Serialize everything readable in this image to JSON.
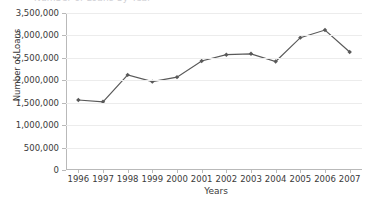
{
  "figure": {
    "cropped_title": "Number of Loans by Year",
    "width": 368,
    "height": 202
  },
  "axes": {
    "ylabel": "Number of Loans",
    "xlabel": "Years",
    "ytick_labels": [
      "0",
      "500,000",
      "1,000,000",
      "1,500,000",
      "2,000,000",
      "2,500,000",
      "3,000,000",
      "3,500,000"
    ],
    "xtick_labels": [
      "1996",
      "1997",
      "1998",
      "1999",
      "2000",
      "2001",
      "2002",
      "2003",
      "2004",
      "2005",
      "2006",
      "2007"
    ]
  },
  "style": {
    "line_color": "#595959",
    "marker_color": "#595959",
    "grid_color": "#ececec",
    "axis_color": "#b9b9b9",
    "text_color": "#3a3a3a",
    "background": "#ffffff"
  },
  "chart_data": {
    "type": "line",
    "title": "Number of Loans by Year",
    "xlabel": "Years",
    "ylabel": "Number of Loans",
    "categories": [
      1996,
      1997,
      1998,
      1999,
      2000,
      2001,
      2002,
      2003,
      2004,
      2005,
      2006,
      2007
    ],
    "values": [
      1560000,
      1520000,
      2120000,
      1970000,
      2070000,
      2430000,
      2570000,
      2590000,
      2420000,
      2950000,
      3120000,
      2630000
    ],
    "ylim": [
      0,
      3500000
    ],
    "ytick_values": [
      0,
      500000,
      1000000,
      1500000,
      2000000,
      2500000,
      3000000,
      3500000
    ],
    "grid": "horizontal",
    "legend": "none",
    "marker": "diamond"
  }
}
